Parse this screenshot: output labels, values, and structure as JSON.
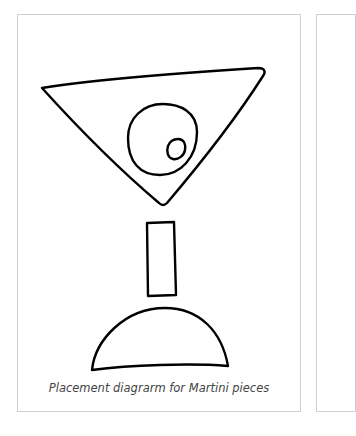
{
  "figure": {
    "caption": "Placement diagrarm for Martini pieces",
    "pieces": [
      {
        "name": "glass-bowl",
        "shape": "triangle"
      },
      {
        "name": "olive",
        "shape": "circle"
      },
      {
        "name": "pimento",
        "shape": "small-circle"
      },
      {
        "name": "stem",
        "shape": "rectangle"
      },
      {
        "name": "base",
        "shape": "half-dome"
      }
    ],
    "stroke_color": "#000000",
    "border_color": "#cfcfcf"
  }
}
